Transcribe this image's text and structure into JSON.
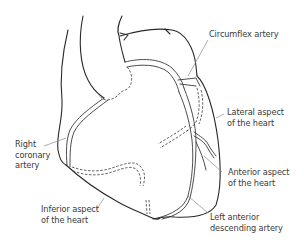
{
  "figure": {
    "labels": {
      "circumflex": "Circumflex artery",
      "lateral": [
        "Lateral aspect",
        "of the heart"
      ],
      "right_coronary": [
        "Right",
        "coronary",
        "artery"
      ],
      "anterior": [
        "Anterior aspect",
        "of the heart"
      ],
      "inferior": [
        "Inferior aspect",
        "of the heart"
      ],
      "lad": [
        "Left anterior",
        "descending artery"
      ]
    }
  }
}
